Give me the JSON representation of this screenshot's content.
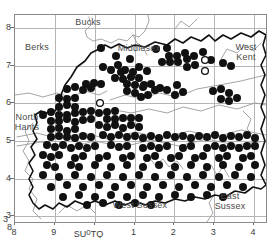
{
  "figure": {
    "kind": "species-distribution-map",
    "region": "Surrey, United Kingdom",
    "background_color": "#ffffff",
    "frame_color": "#8a8a8a",
    "grid_color": "#b5b5b5",
    "county_boundary_color": "#111111",
    "minor_feature_color": "#9a9a9a",
    "dot_fill_color": "#111111",
    "open_dot_color": "#111111"
  },
  "axes": {
    "x_ticks": [
      {
        "label": "8",
        "x": 0
      },
      {
        "label": "9",
        "x": 1
      },
      {
        "label": "0",
        "x": 2
      },
      {
        "label": "1",
        "x": 3
      },
      {
        "label": "2",
        "x": 4
      },
      {
        "label": "3",
        "x": 5
      },
      {
        "label": "4",
        "x": 6
      }
    ],
    "y_ticks": [
      {
        "label": "8",
        "y": 8
      },
      {
        "label": "7",
        "y": 7
      },
      {
        "label": "6",
        "y": 6
      },
      {
        "label": "5",
        "y": 5
      },
      {
        "label": "4",
        "y": 4
      },
      {
        "label": "3",
        "y": 3
      }
    ],
    "grid_square_left": "SU",
    "grid_square_right": "TQ",
    "grid_origin_label": "0",
    "corner_y_label": "3",
    "corner_x_label": "8"
  },
  "region_labels": [
    {
      "name": "bucks",
      "text": "Bucks",
      "x": 88,
      "y": 22
    },
    {
      "name": "berks",
      "text": "Berks",
      "x": 37,
      "y": 47
    },
    {
      "name": "middlesex",
      "text": "Middlesex",
      "x": 139,
      "y": 48
    },
    {
      "name": "west-kent",
      "text": "West\nKent",
      "x": 246,
      "y": 52
    },
    {
      "name": "north-hants",
      "text": "North\nHants",
      "x": 27,
      "y": 122
    },
    {
      "name": "west-sussex",
      "text": "West Sussex",
      "x": 140,
      "y": 205
    },
    {
      "name": "east-sussex",
      "text": "East\nSussex",
      "x": 230,
      "y": 201
    }
  ],
  "chart_data": {
    "type": "scatter",
    "title": "",
    "xlabel": "",
    "ylabel": "",
    "xlim": [
      0,
      6.3
    ],
    "ylim": [
      2.85,
      8.35
    ],
    "grid": true,
    "legend": null,
    "series": [
      {
        "name": "recorded-present",
        "marker": "filled-circle",
        "color": "#111111",
        "count": 218,
        "points": [
          [
            86,
            33
          ],
          [
            101,
            41
          ],
          [
            115,
            44
          ],
          [
            141,
            34
          ],
          [
            152,
            33
          ],
          [
            154,
            41
          ],
          [
            162,
            41
          ],
          [
            170,
            38
          ],
          [
            179,
            41
          ],
          [
            188,
            37
          ],
          [
            147,
            47
          ],
          [
            155,
            47
          ],
          [
            163,
            47
          ],
          [
            172,
            44
          ],
          [
            196,
            45
          ],
          [
            172,
            52
          ],
          [
            180,
            50
          ],
          [
            88,
            52
          ],
          [
            96,
            55
          ],
          [
            103,
            50
          ],
          [
            106,
            57
          ],
          [
            110,
            55
          ],
          [
            118,
            57
          ],
          [
            124,
            52
          ],
          [
            132,
            56
          ],
          [
            100,
            63
          ],
          [
            108,
            64
          ],
          [
            116,
            62
          ],
          [
            124,
            63
          ],
          [
            208,
            48
          ],
          [
            216,
            51
          ],
          [
            71,
            69
          ],
          [
            79,
            68
          ],
          [
            86,
            69
          ],
          [
            52,
            74
          ],
          [
            60,
            72
          ],
          [
            68,
            75
          ],
          [
            76,
            73
          ],
          [
            112,
            69
          ],
          [
            120,
            70
          ],
          [
            128,
            72
          ],
          [
            112,
            76
          ],
          [
            120,
            78
          ],
          [
            126,
            82
          ],
          [
            133,
            80
          ],
          [
            140,
            75
          ],
          [
            129,
            70
          ],
          [
            136,
            69
          ],
          [
            145,
            73
          ],
          [
            152,
            75
          ],
          [
            162,
            70
          ],
          [
            160,
            80
          ],
          [
            168,
            77
          ],
          [
            44,
            83
          ],
          [
            52,
            84
          ],
          [
            60,
            83
          ],
          [
            198,
            76
          ],
          [
            206,
            74
          ],
          [
            214,
            78
          ],
          [
            206,
            84
          ],
          [
            214,
            86
          ],
          [
            222,
            83
          ],
          [
            44,
            92
          ],
          [
            52,
            90
          ],
          [
            60,
            92
          ],
          [
            44,
            100
          ],
          [
            52,
            100
          ],
          [
            60,
            98
          ],
          [
            68,
            97
          ],
          [
            76,
            96
          ],
          [
            84,
            98
          ],
          [
            92,
            97
          ],
          [
            100,
            96
          ],
          [
            36,
            97
          ],
          [
            28,
            100
          ],
          [
            36,
            106
          ],
          [
            44,
            106
          ],
          [
            52,
            104
          ],
          [
            60,
            107
          ],
          [
            68,
            105
          ],
          [
            76,
            104
          ],
          [
            92,
            104
          ],
          [
            100,
            104
          ],
          [
            108,
            103
          ],
          [
            116,
            103
          ],
          [
            124,
            103
          ],
          [
            84,
            110
          ],
          [
            92,
            112
          ],
          [
            100,
            110
          ],
          [
            108,
            113
          ],
          [
            116,
            110
          ],
          [
            124,
            112
          ],
          [
            36,
            114
          ],
          [
            44,
            113
          ],
          [
            52,
            116
          ],
          [
            60,
            114
          ],
          [
            36,
            122
          ],
          [
            44,
            121
          ],
          [
            52,
            122
          ],
          [
            60,
            123
          ],
          [
            68,
            121
          ],
          [
            76,
            122
          ],
          [
            88,
            120
          ],
          [
            96,
            122
          ],
          [
            104,
            120
          ],
          [
            112,
            122
          ],
          [
            120,
            121
          ],
          [
            128,
            123
          ],
          [
            136,
            121
          ],
          [
            144,
            123
          ],
          [
            152,
            120
          ],
          [
            160,
            122
          ],
          [
            168,
            121
          ],
          [
            176,
            123
          ],
          [
            184,
            121
          ],
          [
            192,
            122
          ],
          [
            200,
            120
          ],
          [
            208,
            123
          ],
          [
            216,
            121
          ],
          [
            224,
            122
          ],
          [
            232,
            120
          ],
          [
            240,
            123
          ],
          [
            32,
            130
          ],
          [
            40,
            132
          ],
          [
            48,
            130
          ],
          [
            56,
            133
          ],
          [
            64,
            131
          ],
          [
            72,
            133
          ],
          [
            80,
            131
          ],
          [
            96,
            130
          ],
          [
            104,
            132
          ],
          [
            112,
            131
          ],
          [
            128,
            133
          ],
          [
            136,
            131
          ],
          [
            144,
            133
          ],
          [
            152,
            131
          ],
          [
            168,
            133
          ],
          [
            176,
            131
          ],
          [
            192,
            133
          ],
          [
            200,
            131
          ],
          [
            208,
            133
          ],
          [
            216,
            131
          ],
          [
            224,
            133
          ],
          [
            232,
            131
          ],
          [
            240,
            131
          ],
          [
            28,
            140
          ],
          [
            36,
            142
          ],
          [
            44,
            140
          ],
          [
            60,
            143
          ],
          [
            68,
            141
          ],
          [
            84,
            143
          ],
          [
            92,
            141
          ],
          [
            108,
            143
          ],
          [
            116,
            141
          ],
          [
            132,
            143
          ],
          [
            140,
            141
          ],
          [
            156,
            143
          ],
          [
            164,
            141
          ],
          [
            180,
            143
          ],
          [
            188,
            141
          ],
          [
            204,
            143
          ],
          [
            212,
            141
          ],
          [
            228,
            143
          ],
          [
            236,
            141
          ],
          [
            32,
            150
          ],
          [
            40,
            152
          ],
          [
            56,
            150
          ],
          [
            64,
            152
          ],
          [
            80,
            150
          ],
          [
            96,
            152
          ],
          [
            112,
            150
          ],
          [
            128,
            152
          ],
          [
            144,
            150
          ],
          [
            160,
            152
          ],
          [
            176,
            150
          ],
          [
            192,
            152
          ],
          [
            208,
            150
          ],
          [
            224,
            152
          ],
          [
            240,
            150
          ],
          [
            28,
            160
          ],
          [
            44,
            162
          ],
          [
            60,
            160
          ],
          [
            76,
            162
          ],
          [
            92,
            160
          ],
          [
            108,
            162
          ],
          [
            124,
            160
          ],
          [
            140,
            162
          ],
          [
            156,
            160
          ],
          [
            172,
            162
          ],
          [
            188,
            160
          ],
          [
            204,
            162
          ],
          [
            220,
            160
          ],
          [
            236,
            162
          ],
          [
            36,
            172
          ],
          [
            52,
            170
          ],
          [
            68,
            172
          ],
          [
            84,
            170
          ],
          [
            100,
            172
          ],
          [
            116,
            170
          ],
          [
            132,
            172
          ],
          [
            148,
            170
          ],
          [
            164,
            172
          ],
          [
            180,
            170
          ],
          [
            196,
            172
          ],
          [
            212,
            170
          ],
          [
            228,
            172
          ],
          [
            48,
            182
          ],
          [
            64,
            180
          ],
          [
            80,
            182
          ],
          [
            96,
            180
          ],
          [
            112,
            182
          ],
          [
            128,
            180
          ],
          [
            144,
            182
          ],
          [
            160,
            180
          ],
          [
            176,
            182
          ],
          [
            192,
            180
          ],
          [
            208,
            182
          ],
          [
            72,
            190
          ],
          [
            88,
            188
          ],
          [
            104,
            190
          ],
          [
            120,
            188
          ],
          [
            136,
            190
          ]
        ]
      },
      {
        "name": "recorded-historic",
        "marker": "open-circle",
        "color": "#111111",
        "count": 3,
        "points": [
          [
            85,
            88
          ],
          [
            190,
            45
          ],
          [
            190,
            56
          ]
        ]
      }
    ]
  }
}
